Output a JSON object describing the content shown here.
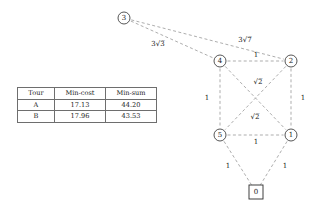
{
  "figure": {
    "caption": "",
    "graph": {
      "nodes": [
        {
          "id": "3",
          "label": "3",
          "shape": "circle",
          "x": 124,
          "y": 18,
          "r": 6
        },
        {
          "id": "4",
          "label": "4",
          "shape": "circle",
          "x": 220,
          "y": 61,
          "r": 6
        },
        {
          "id": "2",
          "label": "2",
          "shape": "circle",
          "x": 291,
          "y": 61,
          "r": 6
        },
        {
          "id": "5",
          "label": "5",
          "shape": "circle",
          "x": 220,
          "y": 135,
          "r": 6
        },
        {
          "id": "1",
          "label": "1",
          "shape": "circle",
          "x": 291,
          "y": 135,
          "r": 6
        },
        {
          "id": "0",
          "label": "0",
          "shape": "box",
          "x": 256,
          "y": 192,
          "r": 7
        }
      ],
      "edges": [
        {
          "from": "3",
          "to": "4",
          "label_coef": "3",
          "label_radicand": "3",
          "label_x": 158,
          "label_y": 44
        },
        {
          "from": "3",
          "to": "2",
          "label_coef": "3",
          "label_radicand": "7",
          "label_x": 245,
          "label_y": 40
        },
        {
          "from": "4",
          "to": "2",
          "label_coef": "1",
          "label_radicand": "",
          "label_x": 256,
          "label_y": 55
        },
        {
          "from": "4",
          "to": "5",
          "label_coef": "1",
          "label_radicand": "",
          "label_x": 207,
          "label_y": 98
        },
        {
          "from": "2",
          "to": "1",
          "label_coef": "1",
          "label_radicand": "",
          "label_x": 303,
          "label_y": 98
        },
        {
          "from": "5",
          "to": "1",
          "label_coef": "1",
          "label_radicand": "",
          "label_x": 256,
          "label_y": 142
        },
        {
          "from": "4",
          "to": "1",
          "label_coef": "",
          "label_radicand": "2",
          "label_x": 258,
          "label_y": 82
        },
        {
          "from": "2",
          "to": "5",
          "label_coef": "",
          "label_radicand": "2",
          "label_x": 255,
          "label_y": 117
        },
        {
          "from": "5",
          "to": "0",
          "label_coef": "1",
          "label_radicand": "",
          "label_x": 228,
          "label_y": 166
        },
        {
          "from": "1",
          "to": "0",
          "label_coef": "1",
          "label_radicand": "",
          "label_x": 285,
          "label_y": 166
        }
      ]
    }
  },
  "table": {
    "headers": [
      "Tour",
      "Min-cost",
      "Min-sum"
    ],
    "rows": [
      {
        "tour": "A",
        "min_cost": "17.13",
        "min_sum": "44.20"
      },
      {
        "tour": "B",
        "min_cost": "17.96",
        "min_sum": "43.53"
      }
    ]
  },
  "colors": {
    "edge": "#8a8a8a",
    "node_stroke": "#2b2b2b",
    "text": "#1a1a1a",
    "table_border": "#6e6e6e",
    "background": "#ffffff"
  }
}
